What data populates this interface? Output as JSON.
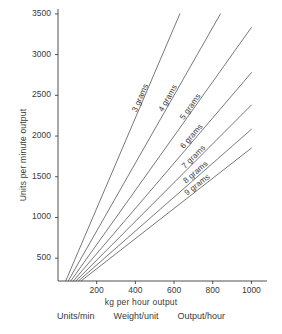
{
  "chart_data": {
    "type": "line",
    "title": "",
    "xlabel": "kg per hour output",
    "ylabel": "Units per minute output",
    "xlim": [
      0,
      1060
    ],
    "ylim": [
      220,
      3560
    ],
    "grid": false,
    "legend_position": "inline-along-lines",
    "xticks": [
      200,
      400,
      600,
      800,
      1000
    ],
    "yticks": [
      500,
      1000,
      1500,
      2000,
      2500,
      3000,
      3500
    ],
    "xtick_labels": [
      "200",
      "400",
      "600",
      "800",
      "1000"
    ],
    "ytick_labels": [
      "500",
      "1000",
      "1500",
      "2000",
      "2500",
      "3000",
      "3500"
    ],
    "annotation": "Each line is output rate for a fixed unit weight in grams; units/min = (kg per hour x 1000) / (grams x 60)",
    "series": [
      {
        "name": "3 grams",
        "label": "3 grams",
        "grams": 3,
        "x": [
          40,
          630
        ],
        "values": [
          222,
          3500
        ],
        "x_end": 630,
        "y_end": 3500,
        "label_x": 630,
        "label_y": 3500
      },
      {
        "name": "4 grams",
        "label": "4 grams",
        "grams": 4,
        "x": [
          53,
          840
        ],
        "values": [
          221,
          3500
        ],
        "x_end": 840,
        "y_end": 3500,
        "label_x": 840,
        "label_y": 3500
      },
      {
        "name": "5 grams",
        "label": "5 grams",
        "grams": 5,
        "x": [
          66,
          1000
        ],
        "values": [
          220,
          3333
        ],
        "x_end": 1000,
        "y_end": 3333,
        "label_x": 1000,
        "label_y": 3333
      },
      {
        "name": "6 grams",
        "label": "6 grams",
        "grams": 6,
        "x": [
          79,
          1000
        ],
        "values": [
          219,
          2778
        ],
        "x_end": 1000,
        "y_end": 2778,
        "label_x": 1000,
        "label_y": 2778
      },
      {
        "name": "7 grams",
        "label": "7 grams",
        "grams": 7,
        "x": [
          92,
          1000
        ],
        "values": [
          219,
          2381
        ],
        "x_end": 1000,
        "y_end": 2381,
        "label_x": 1000,
        "label_y": 2381
      },
      {
        "name": "8 grams",
        "label": "8 grams",
        "grams": 8,
        "x": [
          106,
          1000
        ],
        "values": [
          221,
          2083
        ],
        "x_end": 1000,
        "y_end": 2083,
        "label_x": 1000,
        "label_y": 2083
      },
      {
        "name": "9 grams",
        "label": "9 grams",
        "grams": 9,
        "x": [
          119,
          1000
        ],
        "values": [
          220,
          1852
        ],
        "x_end": 1000,
        "y_end": 1852,
        "label_x": 1000,
        "label_y": 1852
      }
    ]
  },
  "caption": {
    "col1": "Units/min",
    "col2": "Weight/unit",
    "col3": "Output/hour",
    "figure_note": ""
  },
  "colors": {
    "line": "#555555",
    "axis": "#3d3d3d",
    "text": "#3a3a3a",
    "background": "#ffffff"
  }
}
